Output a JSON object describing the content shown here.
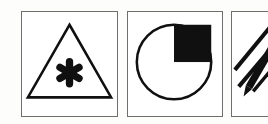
{
  "canvas": {
    "width": 268,
    "height": 124,
    "background_color": "#fdfdfc",
    "title": "Icon sheet: three framed pictogram panels"
  },
  "style": {
    "ink_color": "#101010",
    "frame_color": "#6f6f6f",
    "paper_color": "#ffffff",
    "frame_stroke_width": 1.6
  },
  "panels": [
    {
      "id": "warning-triangle",
      "name": "Warning triangle with asterisk",
      "index": 1,
      "frame": {
        "x": 21,
        "y": 11,
        "width": 97,
        "height": 106
      },
      "art": {
        "type": "triangle-with-asterisk",
        "triangle": {
          "apex": {
            "x": 48.5,
            "y": 13
          },
          "left": {
            "x": 6,
            "y": 87
          },
          "right": {
            "x": 91,
            "y": 87
          },
          "stroke_width": 2.6,
          "fill": "none"
        },
        "asterisk": {
          "center": {
            "x": 48.5,
            "y": 62
          },
          "points": 6,
          "outer_radius": 15,
          "arm_width": 7.5,
          "hub_radius": 5.5,
          "rotation_deg": 0,
          "fill": "#101010"
        }
      }
    },
    {
      "id": "pie-quarter",
      "name": "Circle with filled upper-right quarter",
      "index": 2,
      "frame": {
        "x": 127,
        "y": 11,
        "width": 96,
        "height": 106
      },
      "art": {
        "type": "circle-with-quadrant-fill",
        "circle": {
          "center": {
            "x": 47,
            "y": 51
          },
          "radius": 38,
          "stroke_width": 2.6,
          "fill": "none"
        },
        "filled_quadrant": {
          "quadrant": "upper-right",
          "shape": "square",
          "x": 47,
          "y": 13,
          "width": 38,
          "height": 38,
          "fill": "#101010",
          "fraction": 0.25,
          "label": "25%"
        }
      }
    },
    {
      "id": "pencil-strokes",
      "name": "Pencil with diagonal stroke marks",
      "index": 3,
      "frame": {
        "x": 231,
        "y": 11,
        "width": 54,
        "height": 106
      },
      "clipped_at_right_edge": true,
      "art": {
        "type": "pencil-with-motion-lines",
        "pencil": {
          "angle_deg": -52,
          "body_width": 7.5,
          "tip": {
            "x": 12,
            "y": 86
          },
          "butt": {
            "x": 58,
            "y": 8
          },
          "fill": "#101010"
        },
        "stroke_marks": [
          {
            "x1": 3,
            "y1": 59,
            "x2": 39,
            "y2": 16,
            "width": 4.2
          },
          {
            "x1": 7,
            "y1": 76,
            "x2": 45,
            "y2": 32,
            "width": 4.2
          },
          {
            "x1": 22,
            "y1": 81,
            "x2": 44,
            "y2": 55,
            "width": 3.6
          }
        ],
        "stroke_color": "#101010"
      }
    }
  ]
}
